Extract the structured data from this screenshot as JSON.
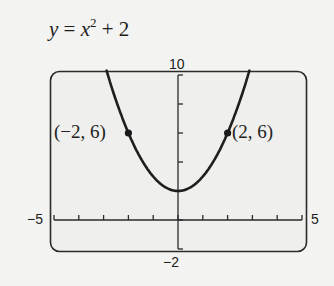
{
  "equation": {
    "lhs": "y",
    "eq": " = ",
    "base": "x",
    "exp": "2",
    "rest": " + 2"
  },
  "window": {
    "ymax_label": "10",
    "ymin_label": "−2",
    "xmin_label": "−5",
    "xmax_label": "5"
  },
  "points": [
    {
      "label": "(−2, 6)"
    },
    {
      "label": "(2, 6)"
    }
  ],
  "chart_data": {
    "type": "line",
    "xlabel": "",
    "ylabel": "",
    "xlim": [
      -5,
      5
    ],
    "ylim": [
      -2,
      10
    ],
    "x_tick_step": 1,
    "y_tick_step": 2,
    "grid": false,
    "series": [
      {
        "name": "y = x^2 + 2",
        "x": [
          -2.9,
          -2.5,
          -2,
          -1.5,
          -1,
          -0.5,
          0,
          0.5,
          1,
          1.5,
          2,
          2.5,
          2.9
        ],
        "y": [
          10.41,
          8.25,
          6,
          4.25,
          3,
          2.25,
          2,
          2.25,
          3,
          4.25,
          6,
          8.25,
          10.41
        ]
      }
    ],
    "annotations": [
      {
        "x": -2,
        "y": 6,
        "text": "(−2, 6)"
      },
      {
        "x": 2,
        "y": 6,
        "text": "(2, 6)"
      }
    ]
  }
}
